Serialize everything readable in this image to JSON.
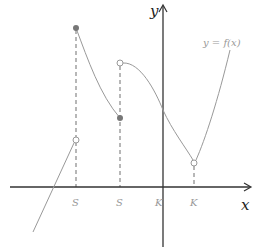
{
  "diagram": {
    "axis_labels": {
      "x": "x",
      "y": "y"
    },
    "function_label": "y = f(x)",
    "tick_labels": [
      "S",
      "S",
      "K",
      "K"
    ],
    "colors": {
      "axis": "#333333",
      "curve": "#999999",
      "dashed": "#888888",
      "closed_dot": "#777777",
      "open_dot_stroke": "#999999",
      "label": "#999999"
    },
    "points": [
      {
        "type": "closed",
        "x": 76,
        "y": 28
      },
      {
        "type": "open",
        "x": 120,
        "y": 63
      },
      {
        "type": "closed",
        "x": 120,
        "y": 118
      },
      {
        "type": "open",
        "x": 76,
        "y": 140
      },
      {
        "type": "open",
        "x": 194,
        "y": 163
      }
    ]
  }
}
